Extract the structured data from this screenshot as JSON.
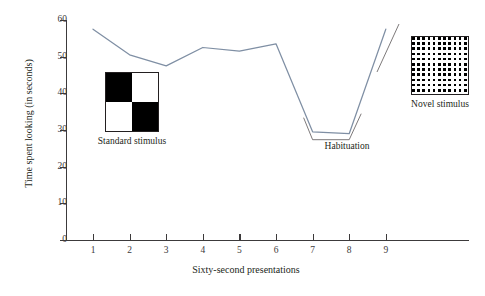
{
  "chart_data": {
    "type": "line",
    "title": "",
    "xlabel": "Sixty-second presentations",
    "ylabel": "Time spent looking (in seconds)",
    "x": [
      1,
      2,
      3,
      4,
      5,
      6,
      7,
      8,
      9
    ],
    "xticklabels": [
      "1",
      "2",
      "3",
      "4",
      "5",
      "6",
      "7",
      "8",
      "9"
    ],
    "yticklabels": [
      "0",
      "10",
      "20",
      "30",
      "40",
      "50",
      "60"
    ],
    "ytickvalues": [
      0,
      10,
      20,
      30,
      40,
      50,
      60
    ],
    "xlim": [
      0.5,
      9.8
    ],
    "ylim": [
      0,
      60
    ],
    "grid": false,
    "legend": null,
    "series": [
      {
        "name": "Time spent looking",
        "color": "#7f8fa4",
        "values": [
          57.5,
          50.5,
          47.5,
          52.5,
          51.5,
          53.5,
          29.5,
          29.0,
          57.5
        ]
      }
    ],
    "annotations": [
      {
        "name": "habituation",
        "label": "Habituation",
        "x_range": [
          7,
          8
        ],
        "value": 29
      }
    ]
  },
  "axes": {
    "y_title": "Time spent looking (in seconds)",
    "x_title": "Sixty-second presentations",
    "y_ticks": [
      {
        "label": "60",
        "value": 60
      },
      {
        "label": "50",
        "value": 50
      },
      {
        "label": "40",
        "value": 40
      },
      {
        "label": "30",
        "value": 30
      },
      {
        "label": "20",
        "value": 20
      },
      {
        "label": "10",
        "value": 10
      },
      {
        "label": "0",
        "value": 0
      }
    ],
    "x_ticks": [
      {
        "label": "1",
        "value": 1
      },
      {
        "label": "2",
        "value": 2
      },
      {
        "label": "3",
        "value": 3
      },
      {
        "label": "4",
        "value": 4
      },
      {
        "label": "5",
        "value": 5
      },
      {
        "label": "6",
        "value": 6
      },
      {
        "label": "7",
        "value": 7
      },
      {
        "label": "8",
        "value": 8
      },
      {
        "label": "9",
        "value": 9
      }
    ]
  },
  "annotations": {
    "habituation_label": "Habituation"
  },
  "stimuli": {
    "standard": {
      "caption": "Standard stimulus",
      "pattern": "2x2-checkerboard",
      "cells": [
        "black",
        "white",
        "white",
        "black"
      ]
    },
    "novel": {
      "caption": "Novel stimulus",
      "pattern": "fine-checkerboard"
    }
  },
  "colors": {
    "line": "#7f8fa4",
    "axis": "#3c3a3b",
    "text": "#231f20",
    "background": "#ffffff"
  }
}
